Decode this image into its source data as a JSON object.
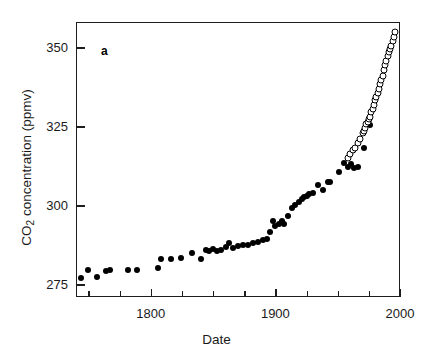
{
  "figure": {
    "panel_label": "a",
    "background": "#ffffff",
    "foreground": "#1a1a1a"
  },
  "chart_data": {
    "type": "scatter",
    "title": "",
    "xlabel": "Date",
    "ylabel": "CO2 concentration (ppmv)",
    "ylabel_parts": {
      "pre": "CO",
      "sub": "2",
      "post": " concentration (ppmv)"
    },
    "xlim": [
      1740,
      2000
    ],
    "ylim": [
      271,
      358
    ],
    "grid": false,
    "legend": null,
    "x_ticks_major": [
      1800,
      1900,
      2000
    ],
    "x_ticks_minor": [
      1750,
      1775,
      1825,
      1850,
      1875,
      1925,
      1950,
      1975
    ],
    "x_ticklabels": [
      "1800",
      "1900",
      "2000"
    ],
    "y_ticks_major": [
      275,
      300,
      325,
      350
    ],
    "y_ticklabels": [
      "275",
      "300",
      "325",
      "350"
    ],
    "series": [
      {
        "name": "Ice core record",
        "marker": "filled-circle",
        "color": "#000000",
        "points": [
          [
            1744,
            277.0
          ],
          [
            1750,
            279.5
          ],
          [
            1757,
            277.2
          ],
          [
            1764,
            279.3
          ],
          [
            1767,
            279.4
          ],
          [
            1782,
            279.5
          ],
          [
            1789,
            279.7
          ],
          [
            1806,
            280.3
          ],
          [
            1808,
            283.0
          ],
          [
            1816,
            283.1
          ],
          [
            1824,
            283.2
          ],
          [
            1833,
            285.0
          ],
          [
            1840,
            283.0
          ],
          [
            1844,
            285.8
          ],
          [
            1847,
            285.6
          ],
          [
            1850,
            286.1
          ],
          [
            1853,
            285.6
          ],
          [
            1856,
            286.0
          ],
          [
            1860,
            286.8
          ],
          [
            1863,
            288.0
          ],
          [
            1866,
            286.6
          ],
          [
            1870,
            287.2
          ],
          [
            1874,
            287.3
          ],
          [
            1878,
            287.5
          ],
          [
            1882,
            288.0
          ],
          [
            1886,
            288.3
          ],
          [
            1890,
            289.1
          ],
          [
            1893,
            289.5
          ],
          [
            1896,
            291.5
          ],
          [
            1898,
            295.0
          ],
          [
            1900,
            293.5
          ],
          [
            1903,
            294.0
          ],
          [
            1905,
            295.0
          ],
          [
            1907,
            294.0
          ],
          [
            1910,
            296.5
          ],
          [
            1913,
            299.0
          ],
          [
            1916,
            300.2
          ],
          [
            1919,
            301.0
          ],
          [
            1921,
            302.0
          ],
          [
            1923,
            302.5
          ],
          [
            1925,
            303.0
          ],
          [
            1927,
            303.6
          ],
          [
            1930,
            304.0
          ],
          [
            1934,
            306.5
          ],
          [
            1938,
            305.0
          ],
          [
            1942,
            307.5
          ],
          [
            1944,
            307.3
          ],
          [
            1951,
            310.5
          ],
          [
            1955,
            313.5
          ],
          [
            1958,
            312.0
          ],
          [
            1961,
            313.0
          ],
          [
            1963,
            311.8
          ],
          [
            1966,
            312.0
          ],
          [
            1971,
            318.0
          ],
          [
            1976,
            325.5
          ]
        ]
      },
      {
        "name": "Mauna Loa record",
        "marker": "open-circle",
        "color": "#000000",
        "points": [
          [
            1958,
            315.0
          ],
          [
            1960,
            316.2
          ],
          [
            1962,
            317.6
          ],
          [
            1964,
            318.0
          ],
          [
            1966,
            319.6
          ],
          [
            1968,
            321.0
          ],
          [
            1970,
            322.8
          ],
          [
            1971,
            323.6
          ],
          [
            1972,
            324.4
          ],
          [
            1973,
            325.8
          ],
          [
            1974,
            326.4
          ],
          [
            1975,
            327.2
          ],
          [
            1976,
            328.0
          ],
          [
            1977,
            329.6
          ],
          [
            1978,
            330.6
          ],
          [
            1979,
            331.6
          ],
          [
            1980,
            333.2
          ],
          [
            1981,
            334.4
          ],
          [
            1982,
            335.4
          ],
          [
            1983,
            336.8
          ],
          [
            1984,
            338.4
          ],
          [
            1985,
            339.8
          ],
          [
            1986,
            341.0
          ],
          [
            1987,
            342.8
          ],
          [
            1988,
            344.4
          ],
          [
            1989,
            345.8
          ],
          [
            1990,
            347.2
          ],
          [
            1991,
            348.6
          ],
          [
            1992,
            349.4
          ],
          [
            1993,
            350.4
          ],
          [
            1994,
            352.0
          ],
          [
            1995,
            353.4
          ],
          [
            1996,
            354.8
          ]
        ]
      }
    ]
  }
}
